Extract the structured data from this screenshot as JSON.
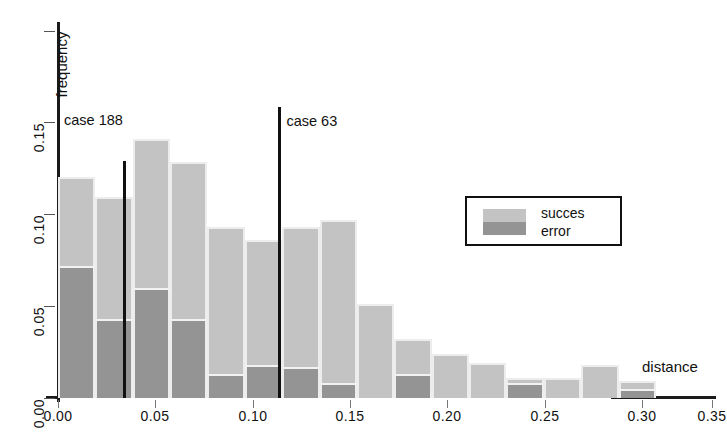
{
  "chart_data": {
    "type": "bar",
    "title": "",
    "xlabel": "distance",
    "ylabel": "frequency",
    "xlim": [
      0.0,
      0.36
    ],
    "ylim": [
      0.0,
      0.162
    ],
    "grid": false,
    "stacked": true,
    "bin_width": 0.02,
    "x_ticks": [
      "0.00",
      "0.05",
      "0.10",
      "0.15",
      "0.20",
      "0.25",
      "0.30",
      "0.35"
    ],
    "x_tick_values": [
      0.0,
      0.05,
      0.1,
      0.15,
      0.2,
      0.25,
      0.3,
      0.35
    ],
    "y_ticks": [
      "0.00",
      "0.05",
      "0.10",
      "0.15"
    ],
    "y_tick_values": [
      0.0,
      0.05,
      0.1,
      0.15
    ],
    "bins": [
      {
        "x0": 0.0,
        "x1": 0.02,
        "total": 0.12,
        "error": 0.072,
        "succes": 0.048
      },
      {
        "x0": 0.02,
        "x1": 0.04,
        "total": 0.109,
        "error": 0.043,
        "succes": 0.066
      },
      {
        "x0": 0.04,
        "x1": 0.06,
        "total": 0.141,
        "error": 0.06,
        "succes": 0.081
      },
      {
        "x0": 0.06,
        "x1": 0.08,
        "total": 0.128,
        "error": 0.043,
        "succes": 0.085
      },
      {
        "x0": 0.08,
        "x1": 0.1,
        "total": 0.093,
        "error": 0.013,
        "succes": 0.08
      },
      {
        "x0": 0.1,
        "x1": 0.12,
        "total": 0.086,
        "error": 0.018,
        "succes": 0.068
      },
      {
        "x0": 0.12,
        "x1": 0.14,
        "total": 0.093,
        "error": 0.017,
        "succes": 0.076
      },
      {
        "x0": 0.14,
        "x1": 0.16,
        "total": 0.097,
        "error": 0.008,
        "succes": 0.089
      },
      {
        "x0": 0.16,
        "x1": 0.18,
        "total": 0.051,
        "error": 0.0,
        "succes": 0.051
      },
      {
        "x0": 0.18,
        "x1": 0.2,
        "total": 0.032,
        "error": 0.013,
        "succes": 0.019
      },
      {
        "x0": 0.2,
        "x1": 0.22,
        "total": 0.024,
        "error": 0.0,
        "succes": 0.024
      },
      {
        "x0": 0.22,
        "x1": 0.24,
        "total": 0.019,
        "error": 0.0,
        "succes": 0.019
      },
      {
        "x0": 0.24,
        "x1": 0.26,
        "total": 0.011,
        "error": 0.008,
        "succes": 0.003
      },
      {
        "x0": 0.26,
        "x1": 0.28,
        "total": 0.011,
        "error": 0.0,
        "succes": 0.011
      },
      {
        "x0": 0.28,
        "x1": 0.3,
        "total": 0.018,
        "error": 0.0,
        "succes": 0.018
      },
      {
        "x0": 0.3,
        "x1": 0.32,
        "total": 0.009,
        "error": 0.005,
        "succes": 0.004
      }
    ],
    "series": [
      {
        "name": "succes",
        "color": "#c3c3c3"
      },
      {
        "name": "error",
        "color": "#949494"
      }
    ],
    "annotations": [
      {
        "label": "case 188",
        "x": 0.0355,
        "type": "vline",
        "y_top": 0.129,
        "y_bottom": 0.0
      },
      {
        "label": "case 63",
        "x": 0.1185,
        "type": "vline",
        "y_top": 0.158,
        "y_bottom": 0.0
      }
    ],
    "legend": {
      "position": "center-right",
      "entries": [
        "succes",
        "error"
      ]
    }
  },
  "legend": {
    "succes": "succes",
    "error": "error"
  },
  "axis_titles": {
    "y": "frequency",
    "x": "distance"
  },
  "annotations": {
    "case188": "case 188",
    "case63": "case 63"
  },
  "colors": {
    "succes": "#c3c3c3",
    "error": "#949494",
    "axis": "#1a1a1a",
    "text": "#111111",
    "background": "#ffffff"
  }
}
